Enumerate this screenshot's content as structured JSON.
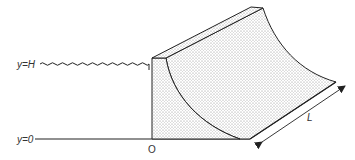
{
  "diagram": {
    "type": "dam cross-section with curved face (hydrostatic force problem)",
    "labels": {
      "water_level": "y=H",
      "ground_level": "y=0",
      "origin": "O",
      "length": "L"
    },
    "colors": {
      "stroke": "#222222",
      "fill_stipple": "#8a8a8a",
      "background": "#ffffff"
    },
    "elements": [
      {
        "name": "water-surface",
        "style": "wavy line",
        "at": "y=H"
      },
      {
        "name": "ground-line",
        "style": "solid line",
        "at": "y=0"
      },
      {
        "name": "dam-block",
        "style": "stippled solid with concave curved face"
      },
      {
        "name": "length-arrow",
        "style": "double-headed arrow",
        "label": "L"
      }
    ]
  }
}
